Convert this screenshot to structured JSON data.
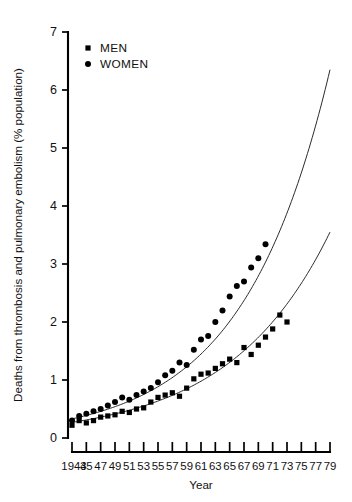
{
  "chart_data": {
    "type": "scatter",
    "title": "",
    "xlabel": "Year",
    "ylabel": "Deaths from thrombosis and pulmonary embolism (% population)",
    "xlim": [
      1943,
      1979
    ],
    "ylim": [
      0,
      7
    ],
    "grid": false,
    "legend_position": "top-left",
    "y_ticks": [
      0,
      1,
      2,
      3,
      4,
      5,
      6,
      7
    ],
    "y_tick_labels": [
      "0",
      "1",
      "2",
      "3",
      "4",
      "5",
      "6",
      "7"
    ],
    "x_ticks": [
      1943,
      1945,
      1947,
      1949,
      1951,
      1953,
      1955,
      1957,
      1959,
      1961,
      1963,
      1965,
      1967,
      1969,
      1971,
      1973,
      1975,
      1977,
      1979
    ],
    "x_tick_labels": [
      "1943",
      "45",
      "47",
      "49",
      "51",
      "53",
      "55",
      "57",
      "59",
      "61",
      "63",
      "65",
      "67",
      "69",
      "71",
      "73",
      "75",
      "77",
      "79"
    ],
    "series": [
      {
        "name": "MEN",
        "marker": "square",
        "color": "#000000",
        "points": [
          {
            "x": 1943,
            "y": 0.22
          },
          {
            "x": 1944,
            "y": 0.3
          },
          {
            "x": 1945,
            "y": 0.26
          },
          {
            "x": 1946,
            "y": 0.3
          },
          {
            "x": 1947,
            "y": 0.36
          },
          {
            "x": 1948,
            "y": 0.38
          },
          {
            "x": 1949,
            "y": 0.4
          },
          {
            "x": 1950,
            "y": 0.46
          },
          {
            "x": 1951,
            "y": 0.44
          },
          {
            "x": 1952,
            "y": 0.5
          },
          {
            "x": 1953,
            "y": 0.52
          },
          {
            "x": 1954,
            "y": 0.62
          },
          {
            "x": 1955,
            "y": 0.7
          },
          {
            "x": 1956,
            "y": 0.74
          },
          {
            "x": 1957,
            "y": 0.78
          },
          {
            "x": 1958,
            "y": 0.72
          },
          {
            "x": 1959,
            "y": 0.86
          },
          {
            "x": 1960,
            "y": 1.02
          },
          {
            "x": 1961,
            "y": 1.1
          },
          {
            "x": 1962,
            "y": 1.12
          },
          {
            "x": 1963,
            "y": 1.2
          },
          {
            "x": 1964,
            "y": 1.28
          },
          {
            "x": 1965,
            "y": 1.36
          },
          {
            "x": 1966,
            "y": 1.3
          },
          {
            "x": 1967,
            "y": 1.56
          },
          {
            "x": 1968,
            "y": 1.44
          },
          {
            "x": 1969,
            "y": 1.6
          },
          {
            "x": 1970,
            "y": 1.74
          },
          {
            "x": 1971,
            "y": 1.88
          },
          {
            "x": 1972,
            "y": 2.12
          },
          {
            "x": 1973,
            "y": 2.0
          }
        ]
      },
      {
        "name": "WOMEN",
        "marker": "circle",
        "color": "#000000",
        "points": [
          {
            "x": 1943,
            "y": 0.3
          },
          {
            "x": 1944,
            "y": 0.38
          },
          {
            "x": 1945,
            "y": 0.42
          },
          {
            "x": 1946,
            "y": 0.46
          },
          {
            "x": 1947,
            "y": 0.5
          },
          {
            "x": 1948,
            "y": 0.56
          },
          {
            "x": 1949,
            "y": 0.62
          },
          {
            "x": 1950,
            "y": 0.7
          },
          {
            "x": 1951,
            "y": 0.66
          },
          {
            "x": 1952,
            "y": 0.74
          },
          {
            "x": 1953,
            "y": 0.8
          },
          {
            "x": 1954,
            "y": 0.86
          },
          {
            "x": 1955,
            "y": 0.96
          },
          {
            "x": 1956,
            "y": 1.08
          },
          {
            "x": 1957,
            "y": 1.16
          },
          {
            "x": 1958,
            "y": 1.3
          },
          {
            "x": 1959,
            "y": 1.26
          },
          {
            "x": 1960,
            "y": 1.52
          },
          {
            "x": 1961,
            "y": 1.7
          },
          {
            "x": 1962,
            "y": 1.76
          },
          {
            "x": 1963,
            "y": 2.0
          },
          {
            "x": 1964,
            "y": 2.2
          },
          {
            "x": 1965,
            "y": 2.44
          },
          {
            "x": 1966,
            "y": 2.62
          },
          {
            "x": 1967,
            "y": 2.7
          },
          {
            "x": 1968,
            "y": 2.94
          },
          {
            "x": 1969,
            "y": 3.1
          },
          {
            "x": 1970,
            "y": 3.34
          }
        ]
      }
    ],
    "fit_curves": [
      {
        "name": "MEN fitted curve",
        "for_series": "MEN",
        "x_start": 1943,
        "x_end": 1979,
        "y_start": 0.27,
        "y_end": 3.55
      },
      {
        "name": "WOMEN fitted curve",
        "for_series": "WOMEN",
        "x_start": 1943,
        "x_end": 1979,
        "y_start": 0.33,
        "y_end": 6.35
      }
    ]
  },
  "legend": {
    "items": [
      {
        "label": "MEN",
        "marker": "square"
      },
      {
        "label": "WOMEN",
        "marker": "circle"
      }
    ]
  }
}
